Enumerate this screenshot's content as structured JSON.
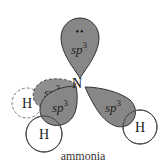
{
  "diagram": {
    "title": "ammonia",
    "central_atom": "N",
    "lone_pair": "••",
    "orbital_label": "sp",
    "orbital_superscript": "3",
    "hydrogen_label": "H",
    "orbitals": [
      {
        "id": "top",
        "label": "sp",
        "sup": "3",
        "has_lone_pair": true
      },
      {
        "id": "back-left",
        "label": "sp",
        "sup": "3",
        "style": "dashed"
      },
      {
        "id": "front-left",
        "label": "sp",
        "sup": "3"
      },
      {
        "id": "right",
        "label": "sp",
        "sup": "3"
      }
    ],
    "hydrogens": [
      {
        "id": "back-left",
        "label": "H",
        "style": "dashed"
      },
      {
        "id": "front-left",
        "label": "H"
      },
      {
        "id": "right",
        "label": "H"
      }
    ],
    "colors": {
      "lobe_fill": "#8a8a8a",
      "lobe_fill_back": "#9a9a9a",
      "outline": "#333333",
      "h_outline": "#555555",
      "background": "#ffffff"
    }
  }
}
